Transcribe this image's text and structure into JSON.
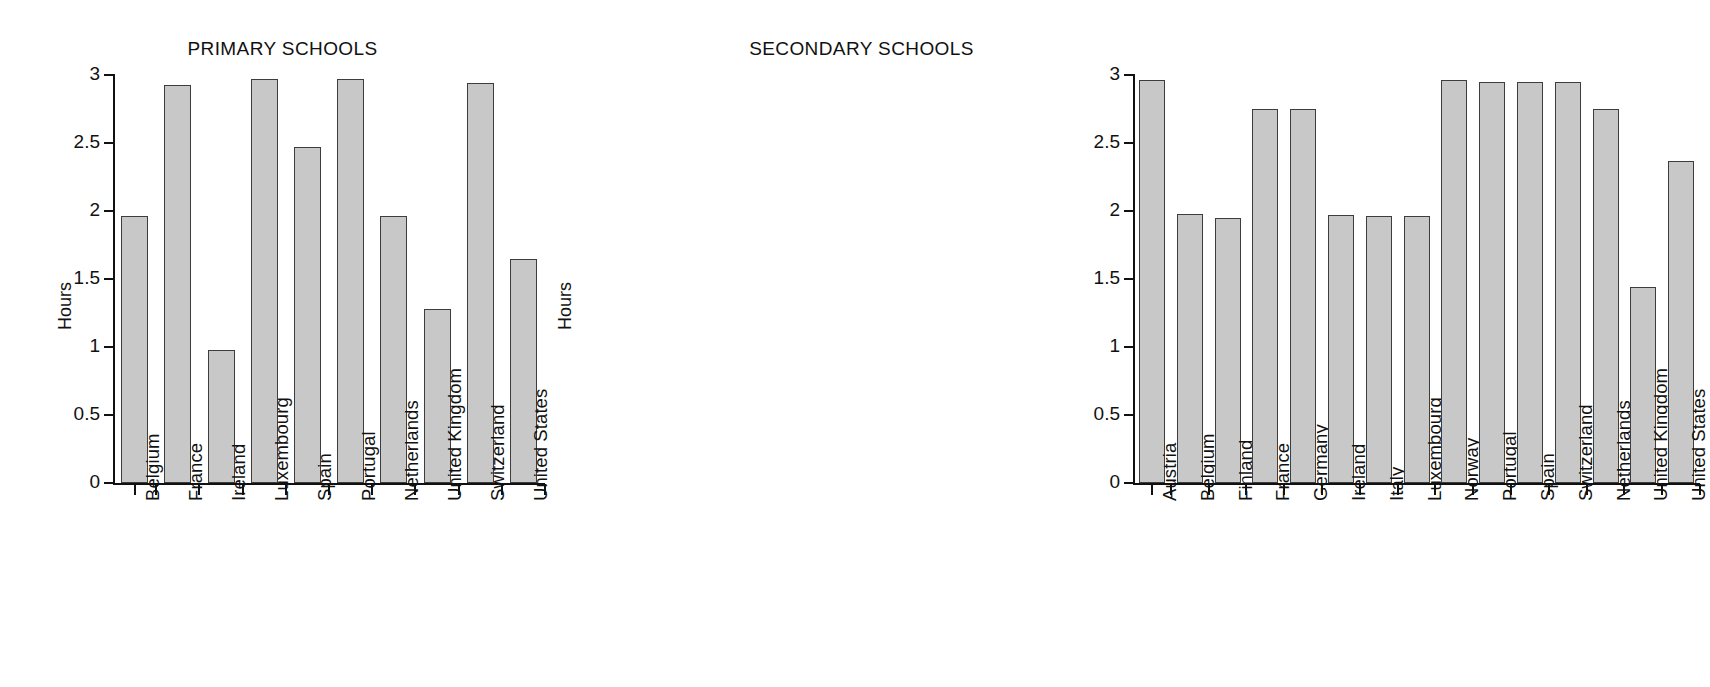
{
  "figure": {
    "background_color": "#ffffff",
    "bar_fill_color": "#c8c8c8",
    "bar_edge_color": "#3d3d3d",
    "axis_color": "#111111"
  },
  "chart_data": [
    {
      "type": "bar",
      "title": "PRIMARY SCHOOLS",
      "xlabel": "",
      "ylabel": "Hours",
      "ylim": [
        0,
        3
      ],
      "yticks": [
        0,
        0.5,
        1,
        1.5,
        2,
        2.5,
        3
      ],
      "ytick_labels": [
        "0",
        "0.5",
        "1",
        "1.5",
        "2",
        "2.5",
        "3"
      ],
      "grid": false,
      "legend": "none",
      "categories": [
        "Belgium",
        "France",
        "Ireland",
        "Luxembourg",
        "Spain",
        "Portugal",
        "Netherlands",
        "United Kingdom",
        "Switzerland",
        "United States"
      ],
      "values": [
        1.96,
        2.93,
        0.98,
        2.97,
        2.47,
        2.97,
        1.96,
        1.28,
        2.94,
        1.65
      ]
    },
    {
      "type": "bar",
      "title": "SECONDARY SCHOOLS",
      "xlabel": "",
      "ylabel": "Hours",
      "ylim": [
        0,
        3
      ],
      "yticks": [
        0,
        0.5,
        1,
        1.5,
        2,
        2.5,
        3
      ],
      "ytick_labels": [
        "0",
        "0.5",
        "1",
        "1.5",
        "2",
        "2.5",
        "3"
      ],
      "grid": false,
      "legend": "none",
      "categories": [
        "Austria",
        "Belgium",
        "Finland",
        "France",
        "Germany",
        "Ireland",
        "Italy",
        "Luxembourg",
        "Norway",
        "Portugal",
        "Spain",
        "Switzerland",
        "Netherlands",
        "United Kingdom",
        "United States"
      ],
      "values": [
        2.96,
        1.98,
        1.95,
        2.75,
        2.75,
        1.97,
        1.96,
        1.96,
        2.96,
        2.95,
        2.95,
        2.95,
        2.75,
        1.44,
        2.37
      ]
    }
  ]
}
